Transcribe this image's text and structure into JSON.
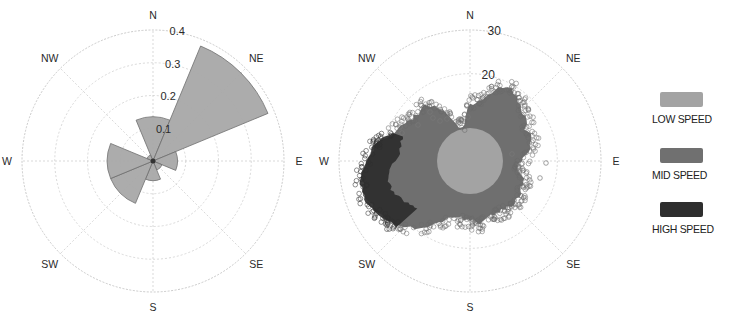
{
  "chart_data": [
    {
      "type": "bar",
      "subtype": "polar-rose",
      "title": "",
      "directions": [
        "N",
        "NE",
        "E",
        "SE",
        "S",
        "SW",
        "W",
        "NW"
      ],
      "sector_width_deg": 45,
      "values": [
        0.135,
        0.38,
        0.075,
        0.03,
        0.06,
        0.14,
        0.14,
        0.02
      ],
      "radial_ticks": [
        "0.1",
        "0.2",
        "0.3",
        "0.4"
      ],
      "radial_tick_values": [
        0.1,
        0.2,
        0.3,
        0.4
      ],
      "rlim": [
        0,
        0.4
      ],
      "grid": true,
      "compass_labels": [
        "N",
        "NE",
        "E",
        "SE",
        "S",
        "SW",
        "W",
        "NW"
      ],
      "fill_color": "#a8a8a8",
      "edge_color": "#6e6e6e"
    },
    {
      "type": "scatter",
      "subtype": "polar-scatter",
      "title": "",
      "radial_ticks": [
        "20",
        "30"
      ],
      "radial_tick_values": [
        20,
        30
      ],
      "rlim": [
        0,
        30
      ],
      "grid": true,
      "compass_labels": [
        "N",
        "NE",
        "E",
        "SE",
        "S",
        "SW",
        "W",
        "NW"
      ],
      "series": [
        {
          "name": "LOW SPEED",
          "color": "#a3a3a3",
          "region": "disc radius ~7.5 around origin"
        },
        {
          "name": "MID SPEED",
          "color": "#6f6f6f",
          "region": "cloud extending to ~20 toward NNE/NE and ~17 toward WSW, ~12 toward S"
        },
        {
          "name": "HIGH SPEED",
          "color": "#2c2c2c",
          "region": "band at ~17-23 toward W/WSW"
        }
      ],
      "legend_position": "right"
    }
  ],
  "legend": {
    "items": [
      {
        "label": "LOW SPEED",
        "color": "#a3a3a3"
      },
      {
        "label": "MID SPEED",
        "color": "#707070"
      },
      {
        "label": "HIGH SPEED",
        "color": "#2e2e2e"
      }
    ]
  }
}
